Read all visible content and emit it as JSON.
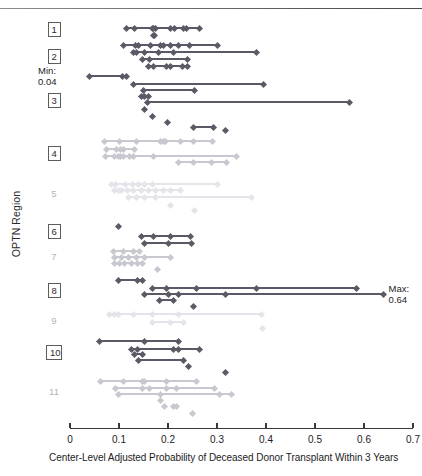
{
  "figure": {
    "y_axis_title": "OPTN Region",
    "x_axis_title": "Center-Level Adjusted Probability of Deceased Donor Transplant Within 3 Years",
    "annotations": [
      {
        "id": "min",
        "line1": "Min:",
        "line2": "0.04",
        "value": 0.04
      },
      {
        "id": "max",
        "line1": "Max:",
        "line2": "0.64",
        "value": 0.64
      }
    ],
    "colors": {
      "dark": "#5a5a66",
      "mid": "#9a9aa4",
      "light": "#c8c8d0",
      "faint": "#e4e4ea",
      "axis": "#3a3a3a",
      "label": "#2b2b2b"
    }
  },
  "chart_data": {
    "type": "scatter",
    "title": "",
    "subtitle": "",
    "xlabel": "Center-Level Adjusted Probability of Deceased Donor Transplant Within 3 Years",
    "ylabel": "OPTN Region",
    "xlim": [
      0,
      0.7
    ],
    "xticks": [
      0,
      0.1,
      0.2,
      0.3,
      0.4,
      0.5,
      0.6,
      0.7
    ],
    "xticklabels": [
      "0",
      "0.1",
      "0.2",
      "0.3",
      "0.4",
      "0.5",
      "0.6",
      "0.7"
    ],
    "grid": false,
    "legend": null,
    "categories": [
      "1",
      "2",
      "3",
      "4",
      "5",
      "6",
      "7",
      "8",
      "9",
      "10",
      "11"
    ],
    "annotations": [
      {
        "text": "Min: 0.04",
        "x": 0.04,
        "series": "3"
      },
      {
        "text": "Max: 0.64",
        "x": 0.64,
        "series": "8"
      }
    ],
    "note": "Each row is a Donation Service Area; diamonds are transplant centers connected by a horizontal range line.",
    "series": [
      {
        "name": "1",
        "shade": "dark",
        "rows": [
          {
            "y": 28,
            "range": [
              0.115,
              0.265
            ],
            "points": [
              0.115,
              0.131,
              0.168,
              0.171,
              0.174,
              0.205,
              0.213,
              0.232,
              0.238,
              0.265
            ]
          },
          {
            "y": 35,
            "points": [
              0.17,
              0.173
            ]
          }
        ]
      },
      {
        "name": "2",
        "shade": "dark",
        "rows": [
          {
            "y": 45,
            "range": [
              0.11,
              0.3
            ],
            "points": [
              0.11,
              0.133,
              0.14,
              0.165,
              0.185,
              0.19,
              0.205,
              0.222,
              0.243,
              0.3
            ]
          },
          {
            "y": 52,
            "range": [
              0.13,
              0.38
            ],
            "points": [
              0.13,
              0.136,
              0.152,
              0.181,
              0.212,
              0.38
            ]
          },
          {
            "y": 59,
            "range": [
              0.148,
              0.24
            ],
            "points": [
              0.148,
              0.163,
              0.24
            ]
          },
          {
            "y": 66,
            "range": [
              0.16,
              0.24
            ],
            "points": [
              0.16,
              0.171,
              0.196,
              0.205,
              0.23,
              0.24
            ]
          }
        ]
      },
      {
        "name": "3",
        "shade": "dark",
        "rows": [
          {
            "y": 76,
            "range": [
              0.04,
              0.115
            ],
            "points": [
              0.04,
              0.108,
              0.115
            ]
          },
          {
            "y": 84,
            "range": [
              0.13,
              0.395
            ],
            "points": [
              0.13,
              0.395
            ]
          },
          {
            "y": 90,
            "range": [
              0.15,
              0.255
            ],
            "points": [
              0.15,
              0.255
            ]
          },
          {
            "y": 96,
            "range": [
              0.145,
              0.16
            ],
            "points": [
              0.145,
              0.152,
              0.16
            ]
          },
          {
            "y": 102,
            "range": [
              0.158,
              0.57
            ],
            "points": [
              0.158,
              0.57
            ]
          },
          {
            "y": 109,
            "points": [
              0.153
            ]
          },
          {
            "y": 116,
            "points": [
              0.168
            ]
          },
          {
            "y": 122,
            "points": [
              0.198
            ]
          },
          {
            "y": 127,
            "range": [
              0.253,
              0.293
            ],
            "points": [
              0.253,
              0.293
            ]
          },
          {
            "y": 130,
            "points": [
              0.318
            ]
          }
        ]
      },
      {
        "name": "4",
        "shade": "light",
        "rows": [
          {
            "y": 141,
            "range": [
              0.07,
              0.29
            ],
            "points": [
              0.07,
              0.1,
              0.136,
              0.185,
              0.19,
              0.194,
              0.225,
              0.252,
              0.29
            ]
          },
          {
            "y": 149,
            "range": [
              0.075,
              0.132
            ],
            "points": [
              0.075,
              0.095,
              0.103,
              0.11,
              0.132
            ]
          },
          {
            "y": 156,
            "range": [
              0.072,
              0.34
            ],
            "points": [
              0.072,
              0.09,
              0.098,
              0.104,
              0.11,
              0.121,
              0.13,
              0.171,
              0.34
            ]
          },
          {
            "y": 162,
            "range": [
              0.222,
              0.32
            ],
            "points": [
              0.222,
              0.253,
              0.288,
              0.32
            ]
          }
        ]
      },
      {
        "name": "5",
        "shade": "faint",
        "rows": [
          {
            "y": 184,
            "range": [
              0.085,
              0.3
            ],
            "points": [
              0.085,
              0.093,
              0.113,
              0.128,
              0.14,
              0.152,
              0.168,
              0.3
            ]
          },
          {
            "y": 190,
            "range": [
              0.09,
              0.225
            ],
            "points": [
              0.09,
              0.098,
              0.106,
              0.118,
              0.13,
              0.145,
              0.16,
              0.175,
              0.19,
              0.205,
              0.225
            ]
          },
          {
            "y": 197,
            "range": [
              0.12,
              0.37
            ],
            "points": [
              0.12,
              0.135,
              0.152,
              0.175,
              0.37
            ]
          },
          {
            "y": 205,
            "points": [
              0.205
            ]
          },
          {
            "y": 210,
            "points": [
              0.255
            ]
          }
        ]
      },
      {
        "name": "6",
        "shade": "dark",
        "rows": [
          {
            "y": 226,
            "points": [
              0.098
            ]
          },
          {
            "y": 236,
            "range": [
              0.145,
              0.245
            ],
            "points": [
              0.145,
              0.17,
              0.205,
              0.245
            ]
          },
          {
            "y": 243,
            "range": [
              0.152,
              0.248
            ],
            "points": [
              0.152,
              0.2,
              0.248
            ]
          }
        ]
      },
      {
        "name": "7",
        "shade": "light",
        "rows": [
          {
            "y": 251,
            "range": [
              0.088,
              0.142
            ],
            "points": [
              0.088,
              0.11,
              0.13,
              0.142
            ]
          },
          {
            "y": 257,
            "range": [
              0.09,
              0.205
            ],
            "points": [
              0.09,
              0.106,
              0.12,
              0.135,
              0.152,
              0.205
            ]
          },
          {
            "y": 263,
            "range": [
              0.09,
              0.148
            ],
            "points": [
              0.09,
              0.1,
              0.112,
              0.125,
              0.138,
              0.148
            ]
          },
          {
            "y": 269,
            "points": [
              0.178
            ]
          }
        ]
      },
      {
        "name": "8",
        "shade": "dark",
        "rows": [
          {
            "y": 280,
            "range": [
              0.098,
              0.148
            ],
            "points": [
              0.098,
              0.138,
              0.148
            ]
          },
          {
            "y": 288,
            "range": [
              0.168,
              0.585
            ],
            "points": [
              0.168,
              0.196,
              0.258,
              0.38,
              0.585
            ]
          },
          {
            "y": 294,
            "range": [
              0.152,
              0.64
            ],
            "points": [
              0.152,
              0.2,
              0.222,
              0.318,
              0.64
            ]
          },
          {
            "y": 300,
            "range": [
              0.182,
              0.212
            ],
            "points": [
              0.182,
              0.212
            ]
          },
          {
            "y": 306,
            "points": [
              0.252
            ]
          }
        ]
      },
      {
        "name": "9",
        "shade": "faint",
        "rows": [
          {
            "y": 314,
            "range": [
              0.08,
              0.39
            ],
            "points": [
              0.08,
              0.09,
              0.098,
              0.13,
              0.168,
              0.222,
              0.39
            ]
          },
          {
            "y": 322,
            "range": [
              0.168,
              0.232
            ],
            "points": [
              0.168,
              0.205,
              0.232
            ]
          },
          {
            "y": 328,
            "points": [
              0.392
            ]
          }
        ]
      },
      {
        "name": "10",
        "shade": "dark",
        "rows": [
          {
            "y": 341,
            "range": [
              0.06,
              0.222
            ],
            "points": [
              0.06,
              0.152,
              0.222
            ]
          },
          {
            "y": 349,
            "range": [
              0.125,
              0.265
            ],
            "points": [
              0.125,
              0.138,
              0.212,
              0.222,
              0.265
            ]
          },
          {
            "y": 354,
            "range": [
              0.132,
              0.148
            ],
            "points": [
              0.132,
              0.148
            ]
          },
          {
            "y": 360,
            "range": [
              0.14,
              0.232
            ],
            "points": [
              0.14,
              0.232
            ]
          },
          {
            "y": 366,
            "points": [
              0.242
            ]
          },
          {
            "y": 372,
            "points": [
              0.318
            ]
          }
        ]
      },
      {
        "name": "11",
        "shade": "light",
        "rows": [
          {
            "y": 381,
            "range": [
              0.062,
              0.258
            ],
            "points": [
              0.062,
              0.11,
              0.148,
              0.152,
              0.196,
              0.258
            ]
          },
          {
            "y": 388,
            "range": [
              0.092,
              0.295
            ],
            "points": [
              0.092,
              0.148,
              0.162,
              0.196,
              0.218,
              0.295
            ]
          },
          {
            "y": 394,
            "range": [
              0.098,
              0.33
            ],
            "points": [
              0.098,
              0.185,
              0.305,
              0.33
            ]
          },
          {
            "y": 400,
            "points": [
              0.185
            ]
          },
          {
            "y": 406,
            "points": [
              0.192,
              0.212,
              0.218
            ]
          },
          {
            "y": 413,
            "points": [
              0.25
            ]
          }
        ]
      }
    ]
  },
  "region_labels": [
    {
      "text": "1",
      "y": 29,
      "boxed": true,
      "faint": false
    },
    {
      "text": "2",
      "y": 56,
      "boxed": true,
      "faint": false
    },
    {
      "text": "3",
      "y": 100,
      "boxed": true,
      "faint": false
    },
    {
      "text": "4",
      "y": 153,
      "boxed": true,
      "faint": false
    },
    {
      "text": "5",
      "y": 194,
      "boxed": false,
      "faint": true
    },
    {
      "text": "6",
      "y": 231,
      "boxed": true,
      "faint": false
    },
    {
      "text": "7",
      "y": 257,
      "boxed": false,
      "faint": true
    },
    {
      "text": "8",
      "y": 290,
      "boxed": true,
      "faint": false
    },
    {
      "text": "9",
      "y": 321,
      "boxed": false,
      "faint": true
    },
    {
      "text": "10",
      "y": 352,
      "boxed": true,
      "faint": false
    },
    {
      "text": "11",
      "y": 392,
      "boxed": false,
      "faint": true
    }
  ]
}
